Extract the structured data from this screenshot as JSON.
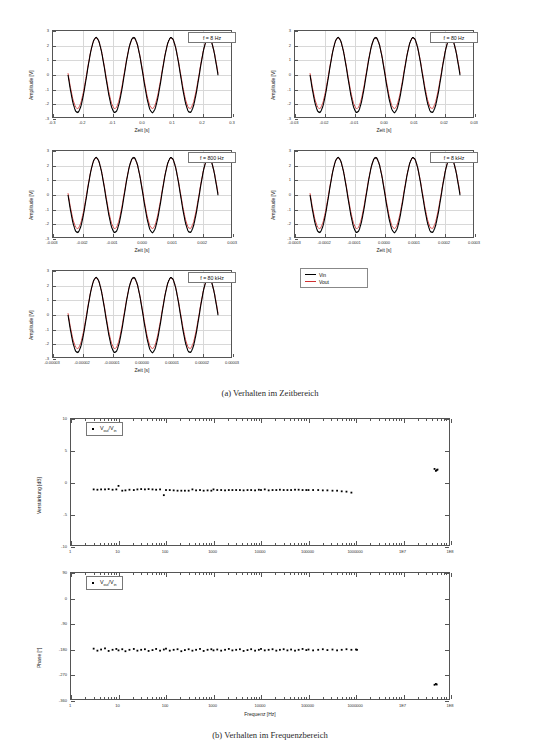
{
  "figure": {
    "subfigure_a": {
      "caption": "(a) Verhalten im Zeitbereich"
    },
    "subfigure_b": {
      "caption": "(b) Verhalten im Frequenzbereich"
    }
  },
  "time_domain": {
    "legend": {
      "vin_label": "Vin",
      "vout_label": "Vout",
      "vin_color": "#000000",
      "vout_color": "#d03030"
    },
    "common": {
      "ylabel": "Amplitude [V]",
      "xlabel": "Zeit [s]",
      "yticks": [
        "3",
        "2",
        "1",
        "0",
        "-1",
        "-2",
        "-3"
      ],
      "ylim": [
        -3,
        3
      ]
    },
    "panels": [
      {
        "id": "p1",
        "freq_label": "f = 8 Hz",
        "freq_hz": 8,
        "xlim": [
          -0.3,
          0.3
        ],
        "xticks": [
          "-0.3",
          "-0.2",
          "-0.1",
          "0.0",
          "0.1",
          "0.2",
          "0.3"
        ],
        "xtickvals": [
          -0.3,
          -0.2,
          -0.1,
          0.0,
          0.1,
          0.2,
          0.3
        ],
        "data_xspan": [
          -0.25,
          0.25
        ]
      },
      {
        "id": "p2",
        "freq_label": "f = 80 Hz",
        "freq_hz": 80,
        "xlim": [
          -0.03,
          0.03
        ],
        "xticks": [
          "-0.03",
          "-0.02",
          "-0.01",
          "0.00",
          "0.01",
          "0.02",
          "0.03"
        ],
        "xtickvals": [
          -0.03,
          -0.02,
          -0.01,
          0.0,
          0.01,
          0.02,
          0.03
        ],
        "data_xspan": [
          -0.025,
          0.025
        ]
      },
      {
        "id": "p3",
        "freq_label": "f = 800 Hz",
        "freq_hz": 800,
        "xlim": [
          -0.003,
          0.003
        ],
        "xticks": [
          "-0.003",
          "-0.002",
          "-0.001",
          "0.000",
          "0.001",
          "0.002",
          "0.003"
        ],
        "xtickvals": [
          -0.003,
          -0.002,
          -0.001,
          0.0,
          0.001,
          0.002,
          0.003
        ],
        "data_xspan": [
          -0.0025,
          0.0025
        ]
      },
      {
        "id": "p4",
        "freq_label": "f = 8 kHz",
        "freq_hz": 8000,
        "xlim": [
          -0.0003,
          0.0003
        ],
        "xticks": [
          "-0.0003",
          "-0.0002",
          "-0.0001",
          "0.0000",
          "0.0001",
          "0.0002",
          "0.0003"
        ],
        "xtickvals": [
          -0.0003,
          -0.0002,
          -0.0001,
          0.0,
          0.0001,
          0.0002,
          0.0003
        ],
        "data_xspan": [
          -0.00025,
          0.00025
        ]
      },
      {
        "id": "p5",
        "freq_label": "f = 80 kHz",
        "freq_hz": 80000,
        "xlim": [
          -3e-05,
          3e-05
        ],
        "xticks": [
          "-0.00003",
          "-0.00002",
          "-0.00001",
          "0.00000",
          "0.00001",
          "0.00002",
          "0.00003"
        ],
        "xtickvals": [
          -3e-05,
          -2e-05,
          -1e-05,
          0.0,
          1e-05,
          2e-05,
          3e-05
        ],
        "data_xspan": [
          -2.5e-05,
          2.5e-05
        ]
      }
    ],
    "waveform": {
      "vin_amplitude": 2.55,
      "vout_amplitude": 2.4,
      "vout_offset": 0.12,
      "cycles_visible": 4,
      "phase_deg": 180
    }
  },
  "chart_data": [
    {
      "type": "scatter",
      "id": "gain-plot",
      "title": "",
      "xlabel": "",
      "ylabel": "Verstärkung [dB]",
      "legend": "Vout/Vin",
      "legend_num": "out",
      "legend_den": "in",
      "xscale": "log",
      "xlim": [
        1,
        100000000
      ],
      "ylim": [
        -10,
        10
      ],
      "xticks": [
        "1",
        "10",
        "100",
        "1000",
        "10000",
        "100000",
        "1000000",
        "1E7",
        "1E8"
      ],
      "xtickvals": [
        1,
        10,
        100,
        1000,
        10000,
        100000,
        1000000,
        10000000,
        100000000
      ],
      "yticks": [
        "10",
        "5",
        "0",
        "-5",
        "-10"
      ],
      "ytickvals": [
        10,
        5,
        0,
        -5,
        -10
      ],
      "grid": false,
      "x": [
        3,
        3.6,
        4.3,
        5.2,
        6.2,
        7.5,
        9,
        10,
        12,
        14,
        17,
        21,
        25,
        30,
        36,
        43,
        52,
        62,
        75,
        90,
        100,
        120,
        145,
        175,
        210,
        250,
        300,
        360,
        430,
        520,
        620,
        750,
        900,
        1000,
        1200,
        1450,
        1750,
        2100,
        2500,
        3000,
        3600,
        4300,
        5200,
        6200,
        7500,
        9000,
        10000,
        12000,
        14500,
        17500,
        21000,
        25000,
        30000,
        36000,
        43000,
        52000,
        62000,
        75000,
        90000,
        100000,
        125000,
        160000,
        200000,
        250000,
        320000,
        400000,
        500000,
        630000,
        800000,
        45000000,
        48000000,
        50000000,
        52000000
      ],
      "y": [
        -1.0,
        -1.05,
        -1.0,
        -1.0,
        -0.95,
        -1.05,
        -1.0,
        -0.45,
        -1.2,
        -1.15,
        -1.05,
        -1.1,
        -1.0,
        -0.95,
        -1.0,
        -0.95,
        -1.0,
        -1.05,
        -1.0,
        -1.9,
        -1.1,
        -1.1,
        -1.15,
        -1.2,
        -1.2,
        -1.2,
        -1.2,
        -1.0,
        -1.15,
        -1.1,
        -1.2,
        -1.15,
        -1.2,
        -1.0,
        -1.1,
        -1.1,
        -1.15,
        -1.1,
        -1.1,
        -1.1,
        -1.1,
        -1.15,
        -1.1,
        -1.1,
        -1.15,
        -1.05,
        -1.1,
        -1.0,
        -1.15,
        -1.1,
        -1.1,
        -1.05,
        -1.1,
        -1.1,
        -1.1,
        -1.05,
        -1.05,
        -1.1,
        -1.1,
        -1.1,
        -1.1,
        -1.1,
        -1.15,
        -1.15,
        -1.2,
        -1.2,
        -1.3,
        -1.35,
        -1.5,
        2.2,
        1.9,
        2.0,
        2.1
      ],
      "notes": "Flat gain near -1 dB from 3 Hz to ~800 kHz; outlier cluster near +2 dB around 5E7 Hz"
    },
    {
      "type": "scatter",
      "id": "phase-plot",
      "title": "",
      "xlabel": "Frequenz [Hz]",
      "ylabel": "Phase [°]",
      "legend": "Vout/Vin",
      "legend_num": "out",
      "legend_den": "in",
      "xscale": "log",
      "xlim": [
        1,
        100000000
      ],
      "ylim": [
        -360,
        90
      ],
      "xticks": [
        "1",
        "10",
        "100",
        "1000",
        "10000",
        "100000",
        "1000000",
        "1E7",
        "1E8"
      ],
      "xtickvals": [
        1,
        10,
        100,
        1000,
        10000,
        100000,
        1000000,
        10000000,
        100000000
      ],
      "yticks": [
        "90",
        "0",
        "-90",
        "-180",
        "-270",
        "-360"
      ],
      "ytickvals": [
        90,
        0,
        -90,
        -180,
        -270,
        -360
      ],
      "grid": false,
      "x": [
        3,
        3.6,
        4.3,
        5.2,
        6.2,
        7.5,
        9,
        10,
        12,
        14,
        17,
        21,
        25,
        30,
        36,
        43,
        52,
        62,
        75,
        90,
        100,
        120,
        145,
        175,
        210,
        250,
        300,
        360,
        430,
        520,
        620,
        750,
        900,
        1000,
        1200,
        1450,
        1750,
        2100,
        2500,
        3000,
        3600,
        4300,
        5200,
        6200,
        7500,
        9000,
        10000,
        12000,
        14500,
        17500,
        21000,
        25000,
        30000,
        36000,
        43000,
        52000,
        62000,
        75000,
        90000,
        100000,
        125000,
        160000,
        200000,
        250000,
        320000,
        400000,
        500000,
        630000,
        800000,
        1000000,
        1050000,
        45000000,
        48000000,
        50000000
      ],
      "y": [
        -176,
        -183,
        -179,
        -175,
        -184,
        -180,
        -177,
        -182,
        -178,
        -185,
        -180,
        -177,
        -183,
        -180,
        -178,
        -184,
        -181,
        -177,
        -183,
        -179,
        -176,
        -183,
        -180,
        -178,
        -185,
        -181,
        -178,
        -183,
        -180,
        -177,
        -184,
        -180,
        -178,
        -182,
        -179,
        -183,
        -180,
        -177,
        -182,
        -180,
        -178,
        -184,
        -181,
        -178,
        -183,
        -180,
        -177,
        -182,
        -180,
        -178,
        -183,
        -180,
        -178,
        -182,
        -179,
        -183,
        -180,
        -177,
        -181,
        -179,
        -182,
        -180,
        -178,
        -181,
        -179,
        -182,
        -180,
        -178,
        -180,
        -179,
        -180,
        -303,
        -300,
        -302
      ],
      "notes": "Phase flat at about -180° across band; drops to about -300° near 5E7 Hz"
    }
  ]
}
